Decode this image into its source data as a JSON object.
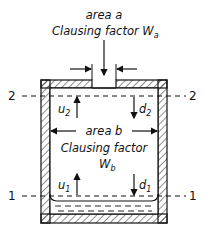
{
  "diagram": {
    "top_label": {
      "line1": "area a",
      "line2": "Clausing factor W",
      "line2_sub": "a"
    },
    "middle_label": {
      "line1": "area b",
      "line2": "Clausing factor",
      "line3": "W",
      "line3_sub": "b"
    },
    "planes": {
      "upper_left": "2",
      "upper_right": "2",
      "lower_left": "1",
      "lower_right": "1"
    },
    "fluxes": {
      "u2": {
        "sym": "u",
        "sub": "2"
      },
      "d2": {
        "sym": "d",
        "sub": "2"
      },
      "u1": {
        "sym": "u",
        "sub": "1"
      },
      "d1": {
        "sym": "d",
        "sub": "1"
      }
    }
  }
}
